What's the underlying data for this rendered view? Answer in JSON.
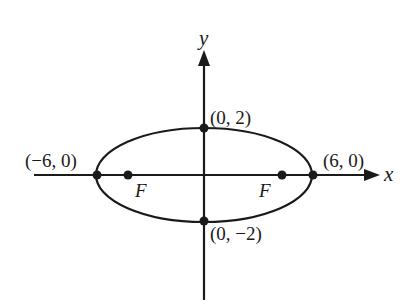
{
  "diagram": {
    "type": "ellipse-on-axes",
    "axes": {
      "x_label": "x",
      "y_label": "y"
    },
    "vertices": [
      {
        "label": "(−6, 0)",
        "x": -6,
        "y": 0
      },
      {
        "label": "(6, 0)",
        "x": 6,
        "y": 0
      },
      {
        "label": "(0, 2)",
        "x": 0,
        "y": 2
      },
      {
        "label": "(0, −2)",
        "x": 0,
        "y": -2
      }
    ],
    "foci": [
      {
        "label": "F",
        "side": "left"
      },
      {
        "label": "F",
        "side": "right"
      }
    ],
    "colors": {
      "stroke": "#1a1a1a",
      "background": "#ffffff"
    }
  }
}
